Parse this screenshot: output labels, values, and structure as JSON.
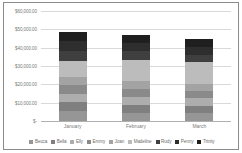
{
  "chart_data": {
    "type": "bar",
    "subtype": "stacked-column",
    "title": "",
    "xlabel": "",
    "ylabel": "",
    "categories": [
      "January",
      "February",
      "March"
    ],
    "ylim": [
      0,
      60000
    ],
    "ytick_values": [
      0,
      10000,
      20000,
      30000,
      40000,
      50000,
      60000
    ],
    "ytick_labels": [
      "$-",
      "$10,000.00",
      "$20,000.00",
      "$30,000.00",
      "$40,000.00",
      "$50,000.00",
      "$60,000.00"
    ],
    "grid": true,
    "legend_position": "bottom",
    "series": [
      {
        "name": "Becca",
        "color": "#969696",
        "values": [
          5200,
          4600,
          4200
        ]
      },
      {
        "name": "Bella",
        "color": "#7f7f7f",
        "values": [
          5000,
          4400,
          4100
        ]
      },
      {
        "name": "Elly",
        "color": "#adadad",
        "values": [
          4800,
          4300,
          4000
        ]
      },
      {
        "name": "Emmy",
        "color": "#8a8a8a",
        "values": [
          4600,
          4200,
          3900
        ]
      },
      {
        "name": "Joan",
        "color": "#a3a3a3",
        "values": [
          4500,
          4100,
          3800
        ]
      },
      {
        "name": "Madeline",
        "color": "#bcbcbc",
        "values": [
          8900,
          11900,
          12000
        ]
      },
      {
        "name": "Rudy",
        "color": "#3f3f3f",
        "values": [
          5300,
          4600,
          4300
        ]
      },
      {
        "name": "Penny",
        "color": "#2e2e2e",
        "values": [
          5200,
          4500,
          4200
        ]
      },
      {
        "name": "Trinity",
        "color": "#1f1f1f",
        "values": [
          5000,
          4400,
          4000
        ]
      }
    ],
    "totals": [
      48500,
      47000,
      40500
    ]
  }
}
